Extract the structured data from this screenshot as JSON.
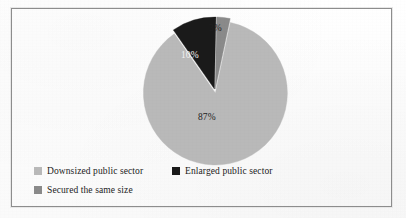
{
  "figure": {
    "background": "#fdfdfd",
    "border_color": "#8d8d8d"
  },
  "chart_data": {
    "type": "pie",
    "title": "",
    "subtitle": "",
    "xlabel": "",
    "ylabel": "",
    "grid": false,
    "legend_position": "bottom",
    "start_angle_deg": 12,
    "direction": "clockwise",
    "exploded": true,
    "explode_gap_px": 2,
    "categories": [
      "Downsized public sector",
      "Enlarged public sector",
      "Secured the same size"
    ],
    "values": [
      87,
      10,
      3
    ],
    "value_labels": [
      "87%",
      "10%",
      "3%"
    ],
    "colors": [
      "#b9b9b9",
      "#1a1a1a",
      "#8a8a8a"
    ],
    "label_colors": [
      "#1d1d1d",
      "#f2f2f2",
      "#1f1f1f"
    ],
    "units": "percent",
    "total": 100,
    "annotations": []
  },
  "pie": {
    "center_x": 215,
    "center_y": 91,
    "radius": 72,
    "labels": {
      "downsized": "87%",
      "enlarged": "10%",
      "secured": "3%"
    }
  },
  "legend": {
    "rows": [
      [
        {
          "label": "Downsized public sector",
          "color": "#b9b9b9"
        },
        {
          "label": "Enlarged public sector",
          "color": "#1a1a1a"
        }
      ],
      [
        {
          "label": "Secured the same size",
          "color": "#8a8a8a"
        }
      ]
    ]
  }
}
